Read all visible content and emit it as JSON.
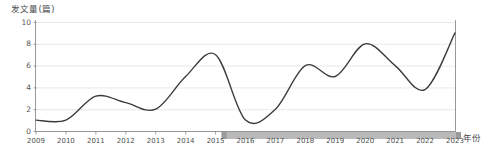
{
  "chart_data": {
    "type": "line",
    "title": "",
    "ylabel": "发文量(篇)",
    "xlabel": "年份",
    "categories": [
      "2009",
      "2010",
      "2011",
      "2012",
      "2013",
      "2014",
      "2015",
      "2016",
      "2017",
      "2018",
      "2019",
      "2020",
      "2021",
      "2022",
      "2023"
    ],
    "values": [
      1,
      1,
      3.2,
      2.6,
      2,
      5,
      7,
      1,
      2,
      6,
      5,
      8,
      6,
      3.8,
      9
    ],
    "series": [
      {
        "name": "发文量",
        "values": [
          1,
          1,
          3.2,
          2.6,
          2,
          5,
          7,
          1,
          2,
          6,
          5,
          8,
          6,
          3.8,
          9
        ]
      }
    ],
    "ylim": [
      0,
      10
    ],
    "y_ticks": [
      "0",
      "2",
      "4",
      "6",
      "8",
      "10"
    ],
    "y_tick_values": [
      0,
      2,
      4,
      6,
      8,
      10
    ],
    "xlim": [
      "2009",
      "2023"
    ],
    "grid": true,
    "legend": "none",
    "line_color": "#3b3b3b",
    "grid_color": "#dfdfdf",
    "axis_color": "#8d8d8d",
    "interpolation": "smooth-spline"
  },
  "range_selector": {
    "start_label": "2015",
    "end_label": "2023",
    "band_color": "#b9b9b9",
    "handle_color": "#9a9a9a"
  }
}
